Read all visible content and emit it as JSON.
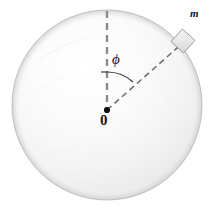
{
  "figure": {
    "type": "physics-diagram",
    "background_color": "#ffffff",
    "sphere": {
      "name": "sphere",
      "center_x": 107,
      "center_y": 105,
      "radius": 95,
      "fill_light": "#fefefe",
      "fill_mid": "#f2f2f2",
      "fill_dark": "#e2e2e2",
      "outline_color": "#b9b9b9"
    },
    "axis_line": {
      "name": "vertical-dashed-axis",
      "from_x": 107,
      "from_y": 11,
      "to_x": 107,
      "to_y": 110,
      "color": "#8c8c8c",
      "dash": "7 5",
      "width": 2.4
    },
    "radius_line": {
      "name": "radius-dashed-line",
      "from_x": 107,
      "from_y": 110,
      "to_x": 184,
      "to_y": 42,
      "color": "#6e6e6e",
      "dash": "6 4",
      "width": 1.6
    },
    "angle_arc": {
      "name": "angle-arc",
      "color": "#3a3a3a",
      "width": 1.2,
      "radius": 38
    },
    "mass_block": {
      "name": "mass-block",
      "center_x": 183,
      "center_y": 41,
      "size": 17,
      "rotation_deg": 42,
      "fill": "#e6e6e6",
      "outline_color": "#9a9a9a"
    },
    "labels": {
      "angle": "ϕ",
      "origin": "0",
      "mass": "m"
    }
  }
}
